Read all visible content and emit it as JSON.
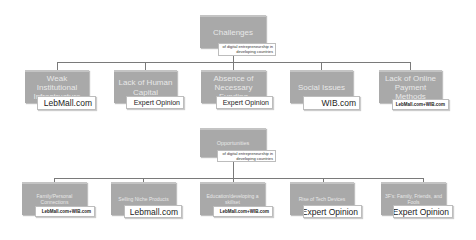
{
  "challenges": {
    "root": {
      "label": "Challenges",
      "sublabel": "of digital entrepreneurship in developing countries"
    },
    "items": [
      {
        "label": "Weak Institutional Infrastructure",
        "source": "LebMall.com"
      },
      {
        "label": "Lack of Human Capital",
        "source": "Expert Opinion"
      },
      {
        "label": "Absence of Necessary Funding",
        "source": "Expert Opinion"
      },
      {
        "label": "Social Issues",
        "source": "WIB.com"
      },
      {
        "label": "Lack of Online Payment Methods",
        "source": "LebMall.com+WIB.com"
      }
    ]
  },
  "opportunities": {
    "root": {
      "label": "Opportunities",
      "sublabel": "of digital entrepreneurship in developing countries"
    },
    "items": [
      {
        "label": "Family/Personal Connections",
        "source": "LebMall.com+WIB.com"
      },
      {
        "label": "Selling Niche Products",
        "source": "Lebmall.com"
      },
      {
        "label": "Education/developing a skillset",
        "source": "LebMall.com+WIB.com"
      },
      {
        "label": "Rise of Tech Devices",
        "source": "Expert Opinion"
      },
      {
        "label": "3F's: Family, Friends, and Fools",
        "source": "Expert Opinion"
      }
    ]
  },
  "colors": {
    "box_fill": "#a9a9a9",
    "connector": "#7a7a7a",
    "tag_fill": "#ffffff"
  }
}
